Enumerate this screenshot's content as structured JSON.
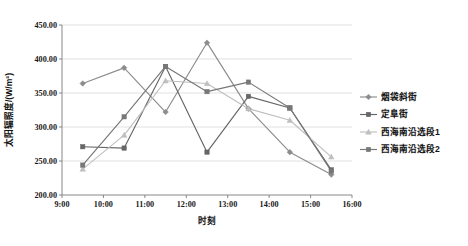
{
  "chart_data": {
    "type": "line",
    "title": "",
    "xlabel": "时刻",
    "ylabel": "太阳辐照度/(W/m²)",
    "ylim": [
      200,
      450
    ],
    "ytick_labels": [
      "200.00",
      "250.00",
      "300.00",
      "350.00",
      "400.00",
      "450.00"
    ],
    "ytick_values": [
      200,
      250,
      300,
      350,
      400,
      450
    ],
    "xtick_labels": [
      "9:00",
      "10:00",
      "11:00",
      "12:00",
      "13:00",
      "14:00",
      "15:00",
      "16:00"
    ],
    "xtick_values": [
      9,
      10,
      11,
      12,
      13,
      14,
      15,
      16
    ],
    "x": [
      9.5,
      10.5,
      11.5,
      12.5,
      13.5,
      14.5,
      15.5
    ],
    "grid": "horizontal",
    "legend_position": "right",
    "series": [
      {
        "name": "烟袋斜街",
        "color": "#8c8c8c",
        "marker": "diamond",
        "values": [
          364,
          387,
          322,
          424,
          327,
          263,
          230
        ]
      },
      {
        "name": "定阜街",
        "color": "#666666",
        "marker": "square",
        "values": [
          271,
          269,
          389,
          263,
          345,
          328,
          237
        ]
      },
      {
        "name": "西海南沿选段1",
        "color": "#bfbfbf",
        "marker": "triangle",
        "values": [
          238,
          288,
          368,
          364,
          327,
          310,
          256
        ]
      },
      {
        "name": "西海南沿选段2",
        "color": "#777777",
        "marker": "square",
        "values": [
          244,
          315,
          389,
          352,
          366,
          328,
          235
        ]
      }
    ]
  },
  "legend": {
    "items": [
      {
        "label": "烟袋斜街"
      },
      {
        "label": "定阜街"
      },
      {
        "label": "西海南沿选段1"
      },
      {
        "label": "西海南沿选段2"
      }
    ]
  }
}
